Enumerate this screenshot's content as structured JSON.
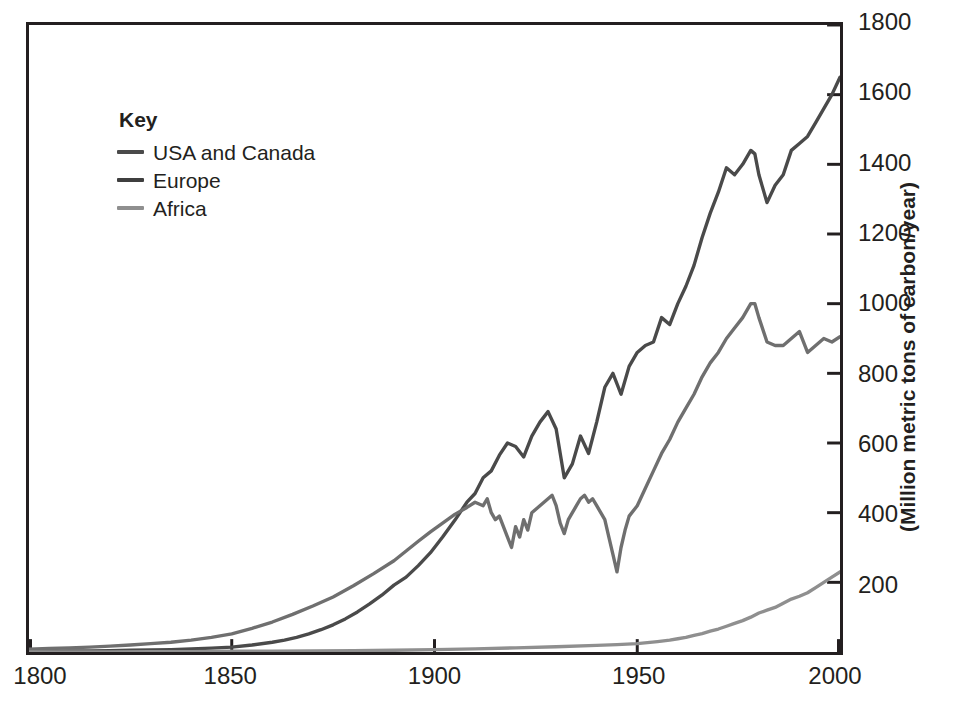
{
  "chart_data": {
    "type": "line",
    "title": "",
    "subtitle": "",
    "xlabel": "",
    "ylabel": "(Million metric tons of carbon/year)",
    "xlim": [
      1800,
      2000
    ],
    "ylim": [
      0,
      1800
    ],
    "grid": false,
    "legend_position": "top-left-inside",
    "legend_title": "Key",
    "x_ticks": [
      1800,
      1850,
      1900,
      1950,
      2000
    ],
    "x_tick_labels": [
      "1800",
      "1850",
      "1900",
      "1950",
      "2000"
    ],
    "y_ticks": [
      200,
      400,
      600,
      800,
      1000,
      1200,
      1400,
      1600,
      1800
    ],
    "y_tick_labels": [
      "200",
      "400",
      "600",
      "800",
      "1000",
      "1200",
      "1400",
      "1600",
      "1800"
    ],
    "series": [
      {
        "name": "USA and Canada",
        "color": "#4a4a4a",
        "x": [
          1800,
          1805,
          1810,
          1815,
          1820,
          1825,
          1830,
          1835,
          1840,
          1845,
          1850,
          1855,
          1860,
          1863,
          1866,
          1869,
          1872,
          1875,
          1878,
          1881,
          1884,
          1887,
          1890,
          1893,
          1896,
          1899,
          1902,
          1905,
          1908,
          1910,
          1912,
          1914,
          1916,
          1918,
          1920,
          1922,
          1924,
          1926,
          1928,
          1930,
          1932,
          1934,
          1936,
          1938,
          1940,
          1942,
          1944,
          1946,
          1948,
          1950,
          1952,
          1954,
          1956,
          1958,
          1960,
          1962,
          1964,
          1966,
          1968,
          1970,
          1972,
          1974,
          1976,
          1978,
          1979,
          1980,
          1982,
          1984,
          1986,
          1988,
          1990,
          1992,
          1994,
          1996,
          1998,
          2000
        ],
        "y": [
          2,
          2,
          3,
          3,
          4,
          5,
          6,
          7,
          9,
          11,
          14,
          20,
          28,
          34,
          42,
          52,
          64,
          78,
          95,
          115,
          138,
          163,
          192,
          215,
          248,
          285,
          330,
          378,
          430,
          455,
          500,
          520,
          565,
          600,
          590,
          560,
          620,
          660,
          690,
          640,
          500,
          540,
          620,
          570,
          660,
          760,
          800,
          740,
          820,
          860,
          880,
          890,
          960,
          940,
          1000,
          1050,
          1110,
          1190,
          1260,
          1320,
          1390,
          1370,
          1400,
          1440,
          1430,
          1370,
          1290,
          1340,
          1370,
          1440,
          1460,
          1480,
          1520,
          1560,
          1600,
          1650
        ],
        "end_value": 1650
      },
      {
        "name": "Europe",
        "color": "#6f6f6f",
        "x": [
          1800,
          1805,
          1810,
          1815,
          1820,
          1825,
          1830,
          1835,
          1840,
          1845,
          1850,
          1855,
          1860,
          1865,
          1870,
          1875,
          1880,
          1885,
          1890,
          1893,
          1896,
          1899,
          1902,
          1905,
          1908,
          1910,
          1912,
          1913,
          1914,
          1915,
          1916,
          1917,
          1918,
          1919,
          1920,
          1921,
          1922,
          1923,
          1924,
          1925,
          1926,
          1927,
          1928,
          1929,
          1930,
          1931,
          1932,
          1933,
          1934,
          1935,
          1936,
          1937,
          1938,
          1939,
          1940,
          1941,
          1942,
          1943,
          1944,
          1945,
          1946,
          1947,
          1948,
          1950,
          1952,
          1954,
          1956,
          1958,
          1960,
          1962,
          1964,
          1966,
          1968,
          1970,
          1972,
          1974,
          1976,
          1978,
          1979,
          1980,
          1982,
          1984,
          1986,
          1988,
          1990,
          1992,
          1994,
          1996,
          1998,
          2000
        ],
        "y": [
          8,
          10,
          12,
          14,
          17,
          20,
          24,
          28,
          34,
          42,
          52,
          68,
          86,
          108,
          132,
          158,
          190,
          225,
          262,
          290,
          318,
          345,
          370,
          395,
          415,
          430,
          420,
          440,
          400,
          380,
          390,
          360,
          330,
          300,
          360,
          330,
          380,
          350,
          400,
          410,
          420,
          430,
          440,
          450,
          420,
          370,
          340,
          380,
          400,
          420,
          440,
          450,
          430,
          440,
          420,
          400,
          380,
          330,
          280,
          230,
          300,
          350,
          390,
          420,
          470,
          520,
          570,
          610,
          660,
          700,
          740,
          790,
          830,
          860,
          900,
          930,
          960,
          1000,
          1000,
          960,
          890,
          880,
          880,
          900,
          920,
          860,
          880,
          900,
          890,
          905
        ],
        "peak_value": 1000,
        "wwii_minimum": 230,
        "end_value": 905
      },
      {
        "name": "Africa",
        "color": "#8f8f8f",
        "x": [
          1800,
          1810,
          1820,
          1830,
          1840,
          1850,
          1860,
          1870,
          1880,
          1890,
          1900,
          1910,
          1920,
          1930,
          1940,
          1945,
          1950,
          1955,
          1958,
          1960,
          1962,
          1964,
          1966,
          1968,
          1970,
          1972,
          1974,
          1976,
          1978,
          1980,
          1982,
          1984,
          1986,
          1988,
          1990,
          1992,
          1994,
          1996,
          1998,
          2000
        ],
        "y": [
          0,
          0,
          0,
          1,
          1,
          2,
          2,
          3,
          4,
          5,
          7,
          9,
          12,
          15,
          19,
          21,
          24,
          30,
          34,
          38,
          42,
          48,
          53,
          60,
          66,
          74,
          82,
          90,
          100,
          112,
          120,
          128,
          140,
          152,
          160,
          170,
          185,
          200,
          215,
          230
        ],
        "end_value": 230
      }
    ]
  },
  "legend": {
    "title": "Key",
    "items": [
      {
        "label": "USA and Canada",
        "color": "#4a4a4a"
      },
      {
        "label": "Europe",
        "color": "#3f3f3f"
      },
      {
        "label": "Africa",
        "color": "#8f8f8f"
      }
    ]
  },
  "axes": {
    "y_title": "(Million metric tons of carbon/year)"
  },
  "colors": {
    "frame": "#231f20",
    "text": "#231f20",
    "background": "#ffffff"
  }
}
